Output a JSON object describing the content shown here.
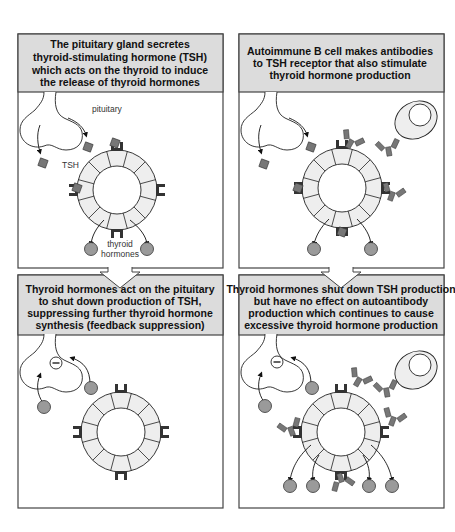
{
  "colors": {
    "header_fill": "#dcdcdc",
    "panel_stroke": "#444444",
    "cell_fill": "#eeeeee",
    "hormone_fill": "#9a9a9a",
    "tsh_fill": "#777777",
    "receptor_fill": "#333333",
    "antibody_fill": "#777777"
  },
  "panels": [
    {
      "id": "tsh-secretion",
      "header_lines": [
        "The pituitary gland secretes",
        "thyroid-stimulating hormone (TSH)",
        "which acts on the thyroid to induce",
        "the release of thyroid hormones"
      ],
      "labels": {
        "pituitary": "pituitary",
        "tsh": "TSH",
        "follicle_1": "thyroid",
        "follicle_2": "follicle",
        "hormones_1": "thyroid",
        "hormones_2": "hormones"
      }
    },
    {
      "id": "autoimmune-stimulation",
      "header_lines": [
        "Autoimmune B cell makes antibodies",
        "to TSH receptor that also stimulate",
        "thyroid hormone production"
      ]
    },
    {
      "id": "feedback-suppression",
      "header_lines": [
        "Thyroid hormones act on the pituitary",
        "to shut down production of TSH,",
        "suppressing further thyroid hormone",
        "synthesis (feedback suppression)"
      ]
    },
    {
      "id": "uncontrolled-production",
      "header_lines": [
        "Thyroid hormones shut down TSH production",
        "but have no effect on autoantibody",
        "production which continues to cause",
        "excessive thyroid hormone production"
      ]
    }
  ],
  "icons": {
    "inhibition": "minus-circle-icon",
    "flow": "down-arrow-icon"
  }
}
